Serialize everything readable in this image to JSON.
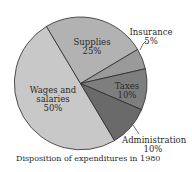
{
  "chart_data": {
    "type": "pie",
    "title": "Disposition of expenditures in 1980",
    "categories": [
      "Wages and salaries",
      "Supplies",
      "Insurance",
      "Taxes",
      "Administration"
    ],
    "values": [
      50,
      25,
      5,
      10,
      10
    ],
    "unit": "%",
    "colors": [
      "#c8c8c8",
      "#b2b2b2",
      "#9a9a9a",
      "#7e7e7e",
      "#6a6a6a"
    ],
    "legend": "none (direct labels)"
  },
  "labels": {
    "wages_line1": "Wages and",
    "wages_line2": "salaries",
    "wages_pct": "50%",
    "supplies": "Supplies",
    "supplies_pct": "25%",
    "insurance": "Insurance",
    "insurance_pct": "5%",
    "taxes": "Taxes",
    "taxes_pct": "10%",
    "administration": "Administration",
    "administration_pct": "10%"
  },
  "caption": "Disposition of expenditures in 1980"
}
